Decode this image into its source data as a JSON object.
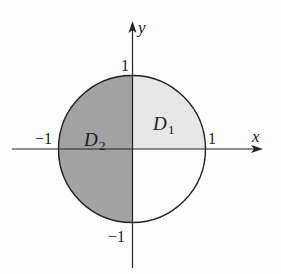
{
  "diagram": {
    "type": "unit-disk-regions",
    "axes": {
      "x_label": "x",
      "y_label": "y"
    },
    "ticks": {
      "x_pos": "1",
      "x_neg": "−1",
      "y_pos": "1",
      "y_neg": "−1"
    },
    "regions": [
      {
        "name": "D",
        "subscript": "1",
        "description": "first quadrant quarter disk",
        "color": "#e6e6e6"
      },
      {
        "name": "D",
        "subscript": "2",
        "description": "left half disk",
        "color": "#9f9f9f"
      }
    ],
    "colors": {
      "stroke": "#222222",
      "background": "#fdfdfd"
    }
  }
}
